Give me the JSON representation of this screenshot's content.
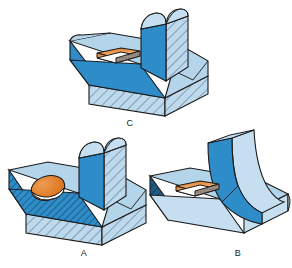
{
  "figure": {
    "kind": "isometric-engineering-drawing",
    "background_color": "#ffffff",
    "outline_color": "#1a1a1a",
    "parts": [
      {
        "id": "C",
        "label": "C",
        "description": "T-shaped base with centered rounded vertical rib and rectangular through hole in left top flange; base and rib side shown sectioned with diagonal hatching",
        "hole_type": "rectangular",
        "rib_top": "rounded",
        "hatching": true,
        "hatch_faces": [
          "base-front",
          "rib-right-side"
        ]
      },
      {
        "id": "A",
        "label": "A",
        "description": "T-shaped base with centered rounded vertical rib and circular through hole in left top flange; base front and left end plus rib side shown sectioned with diagonal hatching",
        "hole_type": "circular",
        "rib_top": "rounded",
        "hatching": true,
        "hatch_faces": [
          "base-front",
          "base-left-end",
          "rib-right-side"
        ]
      },
      {
        "id": "B",
        "label": "B",
        "description": "L-shaped base with curved ogee-profile vertical rib and rectangular through hole in left top flange; no section hatching, solid shaded faces with dark blue left end",
        "hole_type": "rectangular",
        "rib_top": "curved-ogee",
        "hatching": false,
        "hatch_faces": [
          "base-left-end"
        ]
      }
    ]
  },
  "colors": {
    "top_face": "#b4d4ea",
    "top_face_light": "#c6dff0",
    "front_face": "#2e8cc8",
    "front_face_dark": "#1f6fa8",
    "side_face": "#8fc2e0",
    "hatch_base": "#bfd9ec",
    "hatch_line": "#2f5a7a",
    "end_dark": "#1a4a70",
    "hole_bright": "#e98b3c",
    "hole_pale": "#f7d9bd",
    "hole_floor": "#ffffff",
    "hole_shadow": "#6b5f55",
    "outline": "#1a1a1a",
    "label_text": "#1a1a1a"
  },
  "labels": {
    "c": "C",
    "a": "A",
    "b": "B"
  }
}
